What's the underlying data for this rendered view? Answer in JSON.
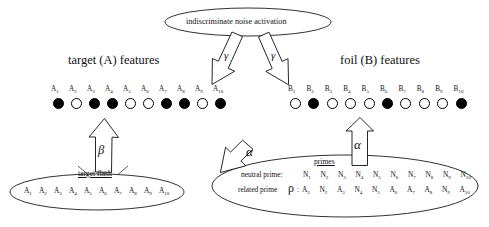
{
  "diagram": {
    "title_top_ellipse": "indiscriminate noise activation",
    "headings": {
      "left": "target (A) features",
      "right": "foil (B) features"
    },
    "target_row": {
      "labels": [
        "A1",
        "A2",
        "A3",
        "A4",
        "A5",
        "A6",
        "A7",
        "A8",
        "A9",
        "A10"
      ],
      "label_base": "A",
      "subs": [
        "1",
        "2",
        "3",
        "4",
        "5",
        "6",
        "7",
        "8",
        "9",
        "10"
      ],
      "states": [
        "on",
        "off",
        "on",
        "on",
        "off",
        "off",
        "on",
        "on",
        "off",
        "on"
      ]
    },
    "foil_row": {
      "labels": [
        "B1",
        "B2",
        "B3",
        "B4",
        "B5",
        "B6",
        "B7",
        "B8",
        "B9",
        "B10"
      ],
      "label_base": "B",
      "subs": [
        "1",
        "2",
        "3",
        "4",
        "5",
        "6",
        "7",
        "8",
        "9",
        "10"
      ],
      "states": [
        "off",
        "on",
        "off",
        "off",
        "off",
        "on",
        "off",
        "off",
        "off",
        "on"
      ]
    },
    "left_ellipse": {
      "caption": "target flash",
      "items_base": "A",
      "subs": [
        "1",
        "2",
        "3",
        "4",
        "5",
        "6",
        "7",
        "8",
        "9",
        "10"
      ]
    },
    "right_ellipse": {
      "caption": "primes",
      "rows": [
        {
          "label": "neutral prime:",
          "rho": "",
          "items": [
            {
              "base": "N",
              "sub": "1"
            },
            {
              "base": "N",
              "sub": "2"
            },
            {
              "base": "N",
              "sub": "3"
            },
            {
              "base": "N",
              "sub": "4"
            },
            {
              "base": "N",
              "sub": "5"
            },
            {
              "base": "N",
              "sub": "6"
            },
            {
              "base": "N",
              "sub": "7"
            },
            {
              "base": "N",
              "sub": "8"
            },
            {
              "base": "N",
              "sub": "9"
            },
            {
              "base": "N",
              "sub": "10"
            }
          ]
        },
        {
          "label": "related prime",
          "rho": "ρ",
          "separator": ":",
          "items": [
            {
              "base": "A",
              "sub": "2"
            },
            {
              "base": "N",
              "sub": "2"
            },
            {
              "base": "A",
              "sub": "3"
            },
            {
              "base": "N",
              "sub": "4"
            },
            {
              "base": "N",
              "sub": "5"
            },
            {
              "base": "A",
              "sub": "6"
            },
            {
              "base": "A",
              "sub": "7"
            },
            {
              "base": "A",
              "sub": "8"
            },
            {
              "base": "N",
              "sub": "9"
            },
            {
              "base": "A",
              "sub": "10"
            }
          ]
        }
      ]
    },
    "arrows": [
      {
        "name": "gamma-left",
        "label": "γ",
        "from": "indiscriminate noise activation",
        "to": "target (A) features"
      },
      {
        "name": "gamma-right",
        "label": "γ",
        "from": "indiscriminate noise activation",
        "to": "foil (B) features"
      },
      {
        "name": "beta",
        "label": "β",
        "from": "target flash",
        "to": "target (A) features"
      },
      {
        "name": "alpha-diagonal",
        "label": "α",
        "from": "primes",
        "to": "target (A) features"
      },
      {
        "name": "alpha-vertical",
        "label": "α",
        "from": "primes",
        "to": "foil (B) features"
      }
    ],
    "colors": {
      "stroke": "#1a1a1a",
      "fill_on": "#000000",
      "fill_off": "#ffffff",
      "background": "#ffffff"
    }
  }
}
